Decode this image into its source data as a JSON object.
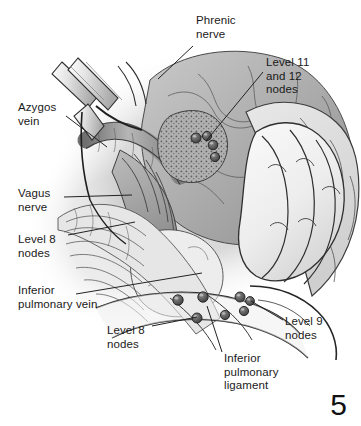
{
  "figure": {
    "kind": "medical-illustration",
    "page_number": "5",
    "background_color": "#ffffff",
    "ink_color": "#1a1a1a",
    "leader_line_color": "#222222"
  },
  "labels": [
    {
      "id": "phrenic-nerve",
      "name": "label-phrenic-nerve",
      "text": "Phrenic\nnerve",
      "x": 196,
      "y": 14,
      "align": "left",
      "leader": "M193,46 L158,79"
    },
    {
      "id": "level-11-12-nodes",
      "name": "label-level-11-and-12-nodes",
      "text": "Level 11\nand 12\nnodes",
      "x": 266,
      "y": 56,
      "align": "left",
      "leader": "M263,72 L206,141"
    },
    {
      "id": "azygos-vein",
      "name": "label-azygos-vein",
      "text": "Azygos\nvein",
      "x": 18,
      "y": 101,
      "align": "left",
      "leader": "M66,116 L107,147"
    },
    {
      "id": "vagus-nerve",
      "name": "label-vagus-nerve",
      "text": "Vagus\nnerve",
      "x": 18,
      "y": 187,
      "align": "left",
      "leader": "M64,197 L132,195"
    },
    {
      "id": "level-8-nodes-left",
      "name": "label-level-8-nodes-upper",
      "text": "Level 8\nnodes",
      "x": 18,
      "y": 233,
      "align": "left",
      "leader": "M68,235 L135,222"
    },
    {
      "id": "inferior-pulmonary-vein",
      "name": "label-inferior-pulmonary-vein",
      "text": "Inferior\npulmonary vein",
      "x": 18,
      "y": 284,
      "align": "left",
      "leader": "M76,294 L202,273"
    },
    {
      "id": "level-8-nodes-bottom",
      "name": "label-level-8-nodes-lower",
      "text": "Level 8\nnodes",
      "x": 107,
      "y": 324,
      "align": "left",
      "leader": "M152,326 L197,317"
    },
    {
      "id": "inferior-pulmonary-ligament",
      "name": "label-inferior-pulmonary-ligament",
      "text": "Inferior\npulmonary\nligament",
      "x": 224,
      "y": 352,
      "align": "left",
      "leader": "M222,352 L207,306"
    },
    {
      "id": "level-9-nodes",
      "name": "label-level-9-nodes",
      "text": "Level 9\nnodes",
      "x": 285,
      "y": 315,
      "align": "left",
      "leader": "M283,320 L251,301"
    }
  ],
  "lymph_nodes": [
    {
      "name": "node-level-11-a",
      "cx": 196,
      "cy": 138,
      "r": 5.0
    },
    {
      "name": "node-level-11-b",
      "cx": 207,
      "cy": 136,
      "r": 4.6
    },
    {
      "name": "node-level-12-a",
      "cx": 213,
      "cy": 145,
      "r": 4.8
    },
    {
      "name": "node-level-12-b",
      "cx": 215,
      "cy": 157,
      "r": 4.6
    },
    {
      "name": "node-level-8-a",
      "cx": 178,
      "cy": 300,
      "r": 5.2
    },
    {
      "name": "node-level-8-b",
      "cx": 203,
      "cy": 297,
      "r": 5.2
    },
    {
      "name": "node-level-8-c",
      "cx": 197,
      "cy": 318,
      "r": 5.0
    },
    {
      "name": "node-level-8-d",
      "cx": 225,
      "cy": 315,
      "r": 4.6
    },
    {
      "name": "node-level-9-a",
      "cx": 240,
      "cy": 297,
      "r": 5.0
    },
    {
      "name": "node-level-9-b",
      "cx": 250,
      "cy": 301,
      "r": 4.4
    },
    {
      "name": "node-level-9-c",
      "cx": 244,
      "cy": 311,
      "r": 4.6
    }
  ]
}
